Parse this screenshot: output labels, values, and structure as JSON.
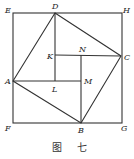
{
  "diagram": {
    "caption": "图 七",
    "outer_square": {
      "labels": [
        "E",
        "H",
        "G",
        "F"
      ]
    },
    "inner_square": {
      "labels": [
        "D",
        "C",
        "B",
        "A"
      ]
    },
    "small_square": {
      "labels": [
        "K",
        "N",
        "M",
        "L"
      ]
    },
    "points": {
      "E": "E",
      "H": "H",
      "F": "F",
      "G": "G",
      "A": "A",
      "B": "B",
      "C": "C",
      "D": "D",
      "K": "K",
      "N": "N",
      "M": "M",
      "L": "L"
    }
  }
}
